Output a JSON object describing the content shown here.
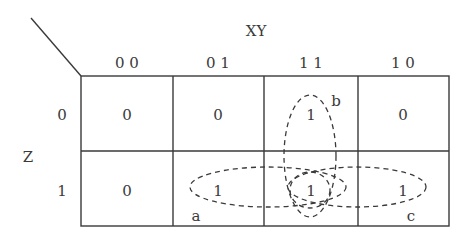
{
  "kmap": {
    "col_variable": "XY",
    "row_variable": "Z",
    "col_headers": [
      "0 0",
      "0 1",
      "1 1",
      "1 0"
    ],
    "row_headers": [
      "0",
      "1"
    ],
    "cells": [
      [
        "0",
        "0",
        "1",
        "0"
      ],
      [
        "0",
        "1",
        "1",
        "1"
      ]
    ],
    "groups": [
      {
        "label": "a",
        "cells": [
          [
            1,
            1
          ],
          [
            1,
            2
          ]
        ]
      },
      {
        "label": "b",
        "cells": [
          [
            0,
            2
          ],
          [
            1,
            2
          ]
        ]
      },
      {
        "label": "c",
        "cells": [
          [
            1,
            2
          ],
          [
            1,
            3
          ]
        ]
      }
    ]
  }
}
